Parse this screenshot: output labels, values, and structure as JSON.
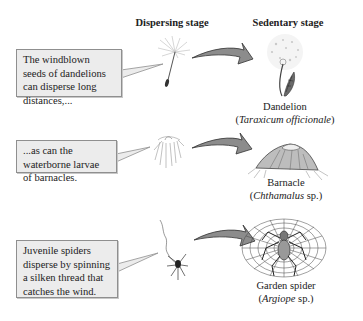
{
  "headers": {
    "dispersing": "Dispersing stage",
    "sedentary": "Sedentary stage"
  },
  "rows": [
    {
      "callout": "The windblown seeds of dandelions can disperse long distances,...",
      "dispersing_icon": "dandelion-seed-icon",
      "sedentary_icon": "dandelion-plant-icon",
      "common_name": "Dandelion",
      "scientific_open": "(",
      "scientific_italic": "Taraxicum officionale",
      "scientific_close": ")"
    },
    {
      "callout": "...as can the waterborne larvae of barnacles.",
      "dispersing_icon": "barnacle-larva-icon",
      "sedentary_icon": "barnacle-icon",
      "common_name": "Barnacle",
      "scientific_open": "(",
      "scientific_italic": "Chthamalus",
      "scientific_close": " sp.)"
    },
    {
      "callout": "Juvenile spiders disperse by spinning a silken thread that catches the wind.",
      "dispersing_icon": "ballooning-spider-icon",
      "sedentary_icon": "garden-spider-web-icon",
      "common_name": "Garden spider",
      "scientific_open": "(",
      "scientific_italic": "Argiope",
      "scientific_close": " sp.)"
    }
  ],
  "colors": {
    "callout_bg": "#ececec",
    "callout_border": "#8f8f8f",
    "arrow_fill": "#8c8c8c",
    "arrow_stroke": "#333333"
  }
}
